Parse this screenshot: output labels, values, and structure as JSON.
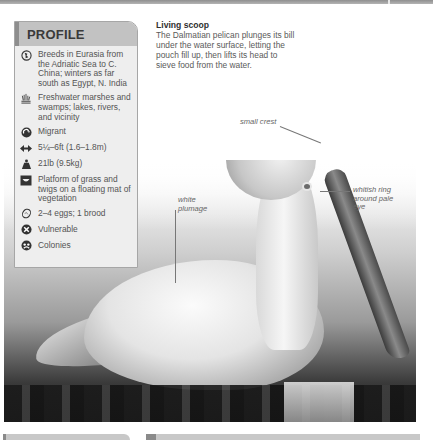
{
  "profile": {
    "title": "PROFILE",
    "items": [
      {
        "icon": "globe-range-icon",
        "text": "Breeds in Eurasia from the Adriatic Sea to C. China; winters as far south as Egypt, N. India"
      },
      {
        "icon": "marsh-habitat-icon",
        "text": "Freshwater marshes and swamps; lakes, rivers, and vicinity"
      },
      {
        "icon": "migration-icon",
        "text": "Migrant"
      },
      {
        "icon": "wingspan-icon",
        "text": "5¼–6ft (1.6–1.8m)"
      },
      {
        "icon": "weight-icon",
        "text": "21lb (9.5kg)"
      },
      {
        "icon": "nest-icon",
        "text": "Platform of grass and twigs on a floating mat of vegetation"
      },
      {
        "icon": "egg-icon",
        "text": "2–4 eggs; 1 brood"
      },
      {
        "icon": "conservation-status-icon",
        "text": "Vulnerable"
      },
      {
        "icon": "social-colony-icon",
        "text": "Colonies"
      }
    ]
  },
  "caption": {
    "title": "Living scoop",
    "body": "The Dalmatian pelican plunges its bill under the water surface, letting the pouch fill up, then lifts its head to sieve food from the water."
  },
  "annotations": {
    "crest": "small crest",
    "plumage": "white plumage",
    "eye": "whitish ring around pale eye"
  },
  "colors": {
    "header_band": "#c2c2c2",
    "profile_bg": "#eeeeee",
    "text": "#545454"
  }
}
